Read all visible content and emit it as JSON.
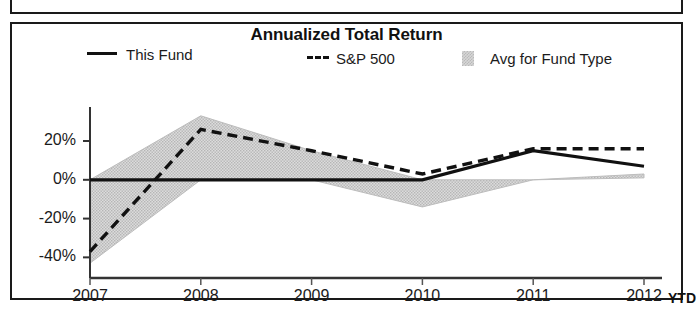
{
  "chart_data": {
    "type": "line",
    "title": "Annualized Total Return",
    "xlabel": "",
    "ylabel": "",
    "categories": [
      "2007",
      "2008",
      "2009",
      "2010",
      "2011",
      "2012"
    ],
    "x_last_suffix": "YTD",
    "xtick_labels": [
      "2007",
      "2008",
      "2009",
      "2010",
      "2011",
      "2012"
    ],
    "ytick_labels": [
      "20%",
      "0%",
      "-20%",
      "-40%"
    ],
    "ytick_values": [
      20,
      0,
      -20,
      -40
    ],
    "ylim": [
      -46,
      36
    ],
    "grid": false,
    "legend_position": "top",
    "series": [
      {
        "name": "This Fund",
        "style": "solid",
        "color": "#111111",
        "values": [
          0,
          0,
          0,
          0,
          15,
          7
        ]
      },
      {
        "name": "S&P 500",
        "style": "dashed",
        "color": "#111111",
        "values": [
          -37,
          26,
          15,
          3,
          16,
          16
        ]
      },
      {
        "name": "Avg for Fund Type",
        "style": "band",
        "color": "#d6d6d6",
        "band_upper": [
          0,
          33,
          15,
          0,
          0,
          3
        ],
        "band_lower": [
          -43,
          0,
          0,
          -14,
          0,
          1
        ]
      }
    ],
    "annotations": []
  },
  "legend": {
    "items": [
      {
        "label": "This Fund",
        "marker": "solid-line-swatch"
      },
      {
        "label": "S&P 500",
        "marker": "dashed-line-swatch"
      },
      {
        "label": "Avg for Fund Type",
        "marker": "gray-box-swatch"
      }
    ]
  },
  "axis": {
    "y_ticks": [
      "20%",
      "0%",
      "-20%",
      "-40%"
    ],
    "x_ticks": [
      "2007",
      "2008",
      "2009",
      "2010",
      "2011",
      "2012"
    ],
    "x_suffix": "YTD"
  }
}
